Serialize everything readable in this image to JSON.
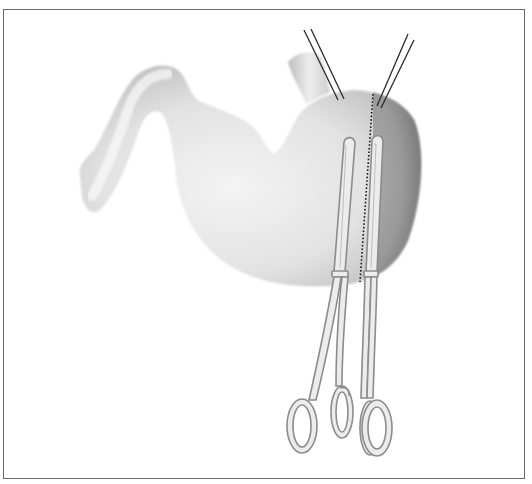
{
  "figure": {
    "frame_color": "#6a6a6a",
    "background": "#ffffff",
    "colors": {
      "stomach_light": "#f2f2f2",
      "stomach_mid": "#d4d4d4",
      "stomach_edge": "#a8a8a8",
      "fundus_dark": "#8a8a8a",
      "fundus_mid": "#a6a6a6",
      "suture": "#2a2a2a",
      "resection_line": "#1a1a1a",
      "clamp_fill": "#e8e8e8",
      "clamp_stroke": "#8c8c8c"
    },
    "elements": [
      {
        "name": "duodenum",
        "shade": "light"
      },
      {
        "name": "stomach-body",
        "shade": "light"
      },
      {
        "name": "esophagus",
        "shade": "light"
      },
      {
        "name": "fundus-region",
        "shade": "dark"
      },
      {
        "name": "resection-line",
        "style": "dotted"
      },
      {
        "name": "stay-suture-left",
        "count": 2
      },
      {
        "name": "stay-suture-right",
        "count": 2
      },
      {
        "name": "clamp-left"
      },
      {
        "name": "clamp-right"
      }
    ]
  }
}
